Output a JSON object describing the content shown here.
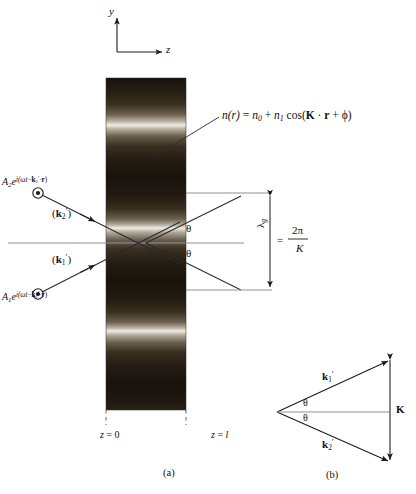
{
  "figure": {
    "axes": {
      "y_label": "y",
      "z_label": "z"
    },
    "index_equation": {
      "n_of_r": "n(r)",
      "equals": "=",
      "n0": "n",
      "n0_sub": "0",
      "plus1": "+",
      "n1": "n",
      "n1_sub": "1",
      "cos": "cos(",
      "K": "K",
      "dot": "·",
      "r": "r",
      "plus2": "+",
      "phi": "ϕ",
      "close": ")",
      "full_text": "n(r) = n0 + n1 cos(K · r + ϕ)"
    },
    "incident_waves": [
      {
        "name": "wave-2",
        "amplitude": "A",
        "amplitude_sub": "2",
        "exp_base": "e",
        "exp_open": "i(",
        "omega_t": "ωt",
        "minus": "−",
        "k": "k",
        "k_sub": "2",
        "prime": "′",
        "dot": "·",
        "r": "r",
        "exp_close": ")",
        "wavevector_label_open": "(",
        "wavevector": "k",
        "wavevector_sub": "2",
        "wavevector_prime": "′",
        "wavevector_label_close": ")",
        "full_text": "A2 e^i(ωt − k2′·r)"
      },
      {
        "name": "wave-1",
        "amplitude": "A",
        "amplitude_sub": "1",
        "exp_base": "e",
        "exp_open": "i(",
        "omega_t": "ωt",
        "minus": "−",
        "k": "k",
        "k_sub": "1",
        "prime": "′",
        "dot": "·",
        "r": "r",
        "exp_close": ")",
        "wavevector_label_open": "(",
        "wavevector": "k",
        "wavevector_sub": "1",
        "wavevector_prime": "′",
        "wavevector_label_close": ")",
        "full_text": "A1 e^i(ωt − k1′·r)"
      }
    ],
    "angles": {
      "theta_upper": "θ",
      "theta_lower": "θ"
    },
    "grating_period": {
      "lambda": "λ",
      "lambda_sub": "g",
      "equals": "=",
      "numerator": "2π",
      "denominator": "K",
      "full_text": "λg = 2π/K"
    },
    "boundaries": {
      "z_start": "z = 0",
      "z_start_var": "z",
      "z_start_eq": "=",
      "z_start_val": "0",
      "z_end": "z = l",
      "z_end_var": "z",
      "z_end_eq": "=",
      "z_end_val": "l"
    },
    "captions": {
      "part_a": "(a)",
      "part_b": "(b)"
    },
    "vector_triangle": {
      "k1": "k",
      "k1_sub": "1",
      "k1_prime": "′",
      "k2": "k",
      "k2_sub": "2",
      "k2_prime": "′",
      "K": "K",
      "theta_upper": "θ",
      "theta_lower": "θ",
      "k1_full": "k1′",
      "k2_full": "k2′",
      "K_full": "K"
    },
    "colors": {
      "background": "#ffffff",
      "line": "#1a1a1a",
      "grating_dark": "#100d07",
      "grating_bright": "#f2efe6",
      "axis_tint": "#8f8f9a"
    },
    "grating_slab": {
      "bright_band_y": [
        125,
        227,
        330
      ],
      "band_period_px": 102,
      "left_px": 106,
      "right_px": 186,
      "top_px": 78,
      "bottom_px": 410
    }
  }
}
